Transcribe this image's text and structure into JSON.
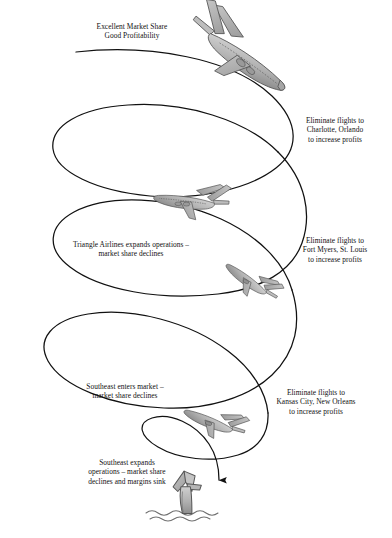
{
  "figure": {
    "background_color": "#ffffff",
    "line_color": "#111111",
    "plane_fill": "#b3b3b3",
    "plane_stroke": "#4a4a4a"
  },
  "captions": [
    {
      "id": "top-left",
      "name": "caption-excellent-market-share",
      "lines": [
        "Excellent Market Share",
        "Good Profitability"
      ],
      "x": 68,
      "y": 22,
      "width": 128,
      "align": "center"
    },
    {
      "id": "right-1",
      "name": "caption-eliminate-charlotte-orlando",
      "lines": [
        "Eliminate flights to",
        "Charlotte, Orlando",
        "to increase profits"
      ],
      "x": 283,
      "y": 116,
      "width": 104,
      "align": "center"
    },
    {
      "id": "left-1",
      "name": "caption-triangle-airlines-expands",
      "lines": [
        "Triangle Airlines expands operations –",
        "market share declines"
      ],
      "x": 50,
      "y": 240,
      "width": 162,
      "align": "center"
    },
    {
      "id": "right-2",
      "name": "caption-eliminate-fort-myers-st-louis",
      "lines": [
        "Eliminate flights to",
        "Fort Myers, St. Louis",
        "to increase profits"
      ],
      "x": 280,
      "y": 236,
      "width": 110,
      "align": "center"
    },
    {
      "id": "left-2",
      "name": "caption-southeast-enters-market",
      "lines": [
        "Southeast enters market –",
        "market share declines"
      ],
      "x": 56,
      "y": 382,
      "width": 138,
      "align": "center"
    },
    {
      "id": "right-3",
      "name": "caption-eliminate-kansas-city-new-orleans",
      "lines": [
        "Eliminate flights to",
        "Kansas City, New Orleans",
        "to increase profits"
      ],
      "x": 248,
      "y": 388,
      "width": 136,
      "align": "center"
    },
    {
      "id": "left-3",
      "name": "caption-southeast-expands-operations",
      "lines": [
        "Southeast expands",
        "operations – market share",
        "declines and margins sink"
      ],
      "x": 56,
      "y": 458,
      "width": 142,
      "align": "center"
    }
  ],
  "planes": [
    {
      "id": "plane-1",
      "name": "airplane-stage-1",
      "x": 185,
      "y": 8,
      "scale": 1.0,
      "rotate": 22,
      "flip": false
    },
    {
      "id": "plane-2",
      "name": "airplane-stage-2",
      "x": 152,
      "y": 168,
      "scale": 0.62,
      "rotate": 27,
      "flip": true
    },
    {
      "id": "plane-3",
      "name": "airplane-stage-3",
      "x": 222,
      "y": 258,
      "scale": 0.5,
      "rotate": 58,
      "flip": true
    },
    {
      "id": "plane-4",
      "name": "airplane-stage-4",
      "x": 184,
      "y": 396,
      "scale": 0.52,
      "rotate": 40,
      "flip": true
    }
  ],
  "wreck": {
    "name": "crashed-airplane-tail-in-water",
    "x": 160,
    "y": 470,
    "label": "tail section sinking in water"
  },
  "arrow": {
    "name": "descent-arrow",
    "description": "arrow head at end of spiral pointing down into the water"
  },
  "water": {
    "name": "water-surface-waves",
    "description": "wavy water line at bottom"
  }
}
